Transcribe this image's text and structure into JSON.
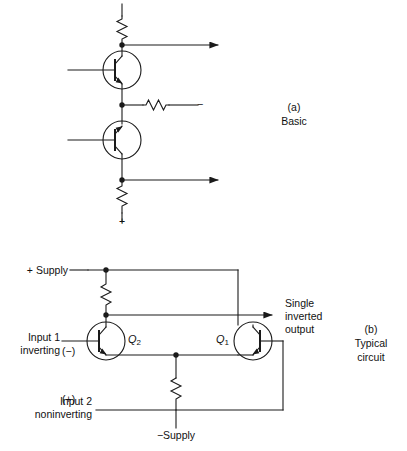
{
  "figure": {
    "background": "#ffffff",
    "line_color": "#1a1a1a",
    "text_color": "#111111"
  },
  "panel_a": {
    "caption_tag": "(a)",
    "caption_text": "Basic",
    "top_rail_sign": "",
    "mid_branch_sign": "−",
    "bottom_rail_sign": "+",
    "components": {
      "top_resistor": "R-top",
      "mid_resistor": "R-mid",
      "bottom_resistor": "R-bottom",
      "upper_transistor": "transistor-upper",
      "lower_transistor": "transistor-lower"
    }
  },
  "panel_b": {
    "caption_tag": "(b)",
    "caption_line1": "Typical",
    "caption_line2": "circuit",
    "positive_supply_label": "+ Supply",
    "negative_supply_label": "−Supply",
    "input1_line1": "Input 1",
    "input1_line2": "inverting",
    "input1_sign": "(−)",
    "input2_line1": "Input 2",
    "input2_line2": "noninverting",
    "input2_sign": "(+)",
    "output_line1": "Single",
    "output_line2": "inverted",
    "output_line3": "output",
    "transistor_q1_label": "Q",
    "transistor_q1_sub": "1",
    "transistor_q2_label": "Q",
    "transistor_q2_sub": "2",
    "components": {
      "collector_resistor": "R-collector",
      "tail_resistor": "R-tail"
    }
  }
}
